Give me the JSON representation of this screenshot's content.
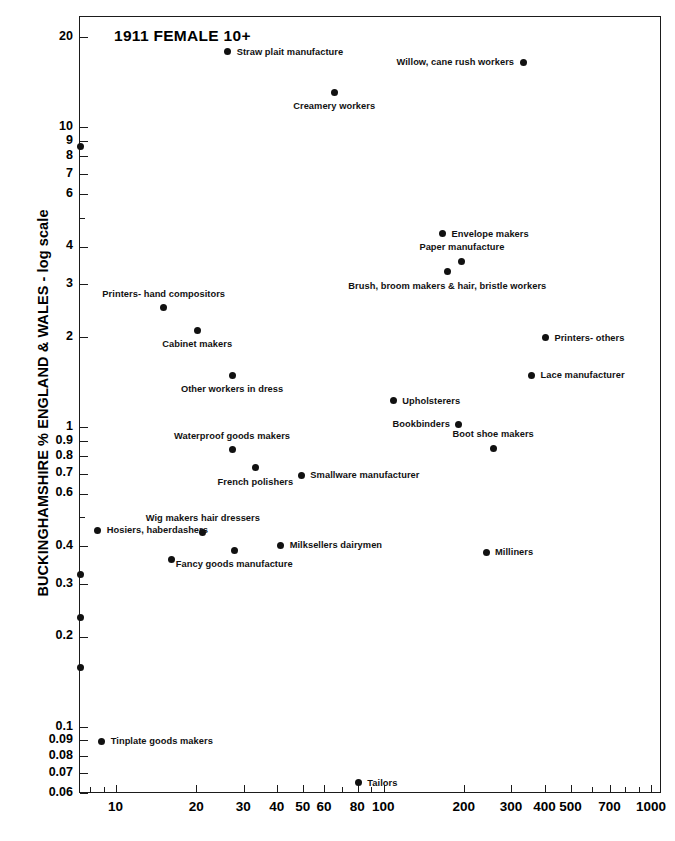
{
  "chart_data": {
    "type": "scatter",
    "title": "1911 FEMALE 10+",
    "xlabel": "",
    "ylabel": "BUCKINGHAMSHIRE % ENGLAND & WALES - log scale",
    "xscale": "log",
    "yscale": "log",
    "xlim": [
      7.3,
      1090
    ],
    "ylim": [
      0.06,
      23.5
    ],
    "grid": false,
    "legend": "none",
    "xticks": [
      {
        "value": 8,
        "label": "",
        "major": false
      },
      {
        "value": 9,
        "label": "",
        "major": false
      },
      {
        "value": 10,
        "label": "10",
        "major": true
      },
      {
        "value": 20,
        "label": "20",
        "major": true
      },
      {
        "value": 30,
        "label": "30",
        "major": true
      },
      {
        "value": 40,
        "label": "40",
        "major": true
      },
      {
        "value": 50,
        "label": "50",
        "major": true
      },
      {
        "value": 60,
        "label": "60",
        "major": true
      },
      {
        "value": 70,
        "label": "",
        "major": false
      },
      {
        "value": 80,
        "label": "80",
        "major": true
      },
      {
        "value": 90,
        "label": "",
        "major": false
      },
      {
        "value": 100,
        "label": "100",
        "major": true
      },
      {
        "value": 200,
        "label": "200",
        "major": true
      },
      {
        "value": 300,
        "label": "300",
        "major": true
      },
      {
        "value": 400,
        "label": "400",
        "major": true
      },
      {
        "value": 500,
        "label": "500",
        "major": true
      },
      {
        "value": 600,
        "label": "",
        "major": false
      },
      {
        "value": 700,
        "label": "700",
        "major": true
      },
      {
        "value": 800,
        "label": "",
        "major": false
      },
      {
        "value": 900,
        "label": "",
        "major": false
      },
      {
        "value": 1000,
        "label": "1000",
        "major": true
      }
    ],
    "yticks": [
      {
        "value": 20,
        "label": "20",
        "major": true
      },
      {
        "value": 10,
        "label": "10",
        "major": true
      },
      {
        "value": 9,
        "label": "9",
        "major": true
      },
      {
        "value": 8,
        "label": "8",
        "major": true
      },
      {
        "value": 7,
        "label": "7",
        "major": true
      },
      {
        "value": 6,
        "label": "6",
        "major": true
      },
      {
        "value": 5,
        "label": "",
        "major": false
      },
      {
        "value": 4,
        "label": "4",
        "major": true
      },
      {
        "value": 3,
        "label": "3",
        "major": true
      },
      {
        "value": 2,
        "label": "2",
        "major": true
      },
      {
        "value": 1,
        "label": "1",
        "major": true
      },
      {
        "value": 0.9,
        "label": "0.9",
        "major": true
      },
      {
        "value": 0.8,
        "label": "0.8",
        "major": true
      },
      {
        "value": 0.7,
        "label": "0.7",
        "major": true
      },
      {
        "value": 0.6,
        "label": "0.6",
        "major": true
      },
      {
        "value": 0.5,
        "label": "",
        "major": false
      },
      {
        "value": 0.4,
        "label": "0.4",
        "major": true
      },
      {
        "value": 0.3,
        "label": "0.3",
        "major": true
      },
      {
        "value": 0.2,
        "label": "0.2",
        "major": true
      },
      {
        "value": 0.1,
        "label": "0.1",
        "major": true
      },
      {
        "value": 0.09,
        "label": "0.09",
        "major": true
      },
      {
        "value": 0.08,
        "label": "0.08",
        "major": true
      },
      {
        "value": 0.07,
        "label": "0.07",
        "major": true
      },
      {
        "value": 0.06,
        "label": "0.06",
        "major": true
      }
    ],
    "points": [
      {
        "label": "Straw plait manufacture",
        "x": 26,
        "y": 18.0,
        "side": "rgt"
      },
      {
        "label": "Willow, cane rush workers",
        "x": 330,
        "y": 16.6,
        "side": "lft"
      },
      {
        "label": "Creamery workers",
        "x": 65,
        "y": 13.2,
        "side": "below"
      },
      {
        "label": "Envelope makers",
        "x": 165,
        "y": 4.45,
        "side": "rgt"
      },
      {
        "label": "Paper manufacture",
        "x": 195,
        "y": 3.6,
        "side": "above"
      },
      {
        "label": "Brush, broom makers & hair, bristle workers",
        "x": 172,
        "y": 3.32,
        "side": "below"
      },
      {
        "label": "Printers- hand compositors",
        "x": 15,
        "y": 2.52,
        "side": "above"
      },
      {
        "label": "Printers- others",
        "x": 400,
        "y": 2.0,
        "side": "rgt"
      },
      {
        "label": "Cabinet makers",
        "x": 20,
        "y": 2.12,
        "side": "below"
      },
      {
        "label": "Lace manufacturer",
        "x": 355,
        "y": 1.5,
        "side": "rgt"
      },
      {
        "label": "Other workers in dress",
        "x": 27,
        "y": 1.5,
        "side": "below"
      },
      {
        "label": "Upholsterers",
        "x": 108,
        "y": 1.23,
        "side": "rgt"
      },
      {
        "label": "Bookbinders",
        "x": 190,
        "y": 1.03,
        "side": "lft"
      },
      {
        "label": "Boot shoe makers",
        "x": 255,
        "y": 0.855,
        "side": "above"
      },
      {
        "label": "Waterproof goods makers",
        "x": 27,
        "y": 0.845,
        "side": "above"
      },
      {
        "label": "French polishers",
        "x": 33,
        "y": 0.735,
        "side": "below"
      },
      {
        "label": "Smallware manufacturer",
        "x": 49,
        "y": 0.695,
        "side": "rgt"
      },
      {
        "label": "Hosiers, haberdashers",
        "x": 8.5,
        "y": 0.455,
        "side": "rgt"
      },
      {
        "label": "Wig makers hair dressers",
        "x": 21,
        "y": 0.448,
        "side": "above"
      },
      {
        "label": "Milksellers dairymen",
        "x": 41,
        "y": 0.405,
        "side": "rgt"
      },
      {
        "label": "Milliners",
        "x": 240,
        "y": 0.385,
        "side": "rgt"
      },
      {
        "label": "Fancy goods manufacture",
        "x": 27.5,
        "y": 0.39,
        "side": "below"
      },
      {
        "label": "",
        "x": 16,
        "y": 0.365,
        "side": "none"
      },
      {
        "label": "Tinplate goods makers",
        "x": 8.8,
        "y": 0.09,
        "side": "rgt"
      },
      {
        "label": "Tailors",
        "x": 80,
        "y": 0.0655,
        "side": "rgt"
      }
    ],
    "edge_points": [
      {
        "y": 8.7
      },
      {
        "y": 0.325
      },
      {
        "y": 0.232
      },
      {
        "y": 0.158
      }
    ]
  },
  "colors": {
    "ink": "#111111",
    "frame": "#1b1b1b",
    "background": "#ffffff"
  }
}
